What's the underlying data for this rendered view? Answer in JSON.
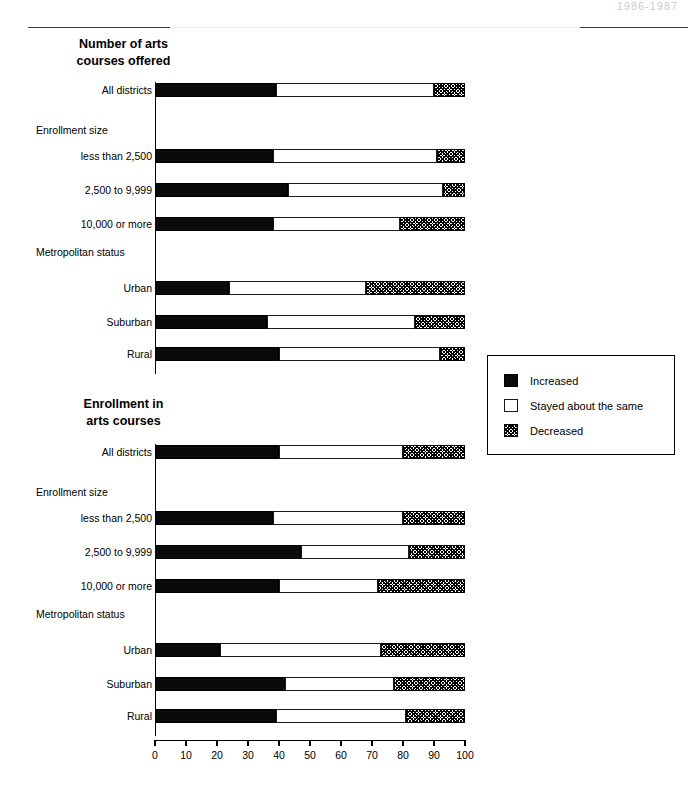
{
  "header": {
    "year_range": "1986-1987"
  },
  "legend": {
    "items": [
      {
        "label": "Increased",
        "key": "increased",
        "color": "#000000"
      },
      {
        "label": "Stayed about the same",
        "key": "same",
        "color": "#ffffff"
      },
      {
        "label": "Decreased",
        "key": "decreased",
        "color": "#7a7a7a"
      }
    ]
  },
  "axis": {
    "ticks": [
      "0",
      "10",
      "20",
      "30",
      "40",
      "50",
      "60",
      "70",
      "80",
      "90",
      "100"
    ],
    "min": 0,
    "max": 100
  },
  "group_labels": {
    "enrollment_size": "Enrollment size",
    "metropolitan_status": "Metropolitan status"
  },
  "chart_data": [
    {
      "type": "bar",
      "orientation": "horizontal",
      "stacked": true,
      "title": "Number of arts\ncourses offered",
      "xlabel": "",
      "ylabel": "",
      "xlim": [
        0,
        100
      ],
      "grid": false,
      "legend_position": "right",
      "series": [
        {
          "name": "Increased",
          "values": [
            39,
            38,
            43,
            38,
            24,
            36,
            40
          ]
        },
        {
          "name": "Stayed about the same",
          "values": [
            51,
            53,
            50,
            41,
            44,
            48,
            52
          ]
        },
        {
          "name": "Decreased",
          "values": [
            10,
            9,
            7,
            21,
            32,
            16,
            8
          ]
        }
      ],
      "categories": [
        "All districts",
        "less than 2,500",
        "2,500 to 9,999",
        "10,000 or more",
        "Urban",
        "Suburban",
        "Rural"
      ],
      "rows": [
        {
          "label": "All districts",
          "kind": "bar",
          "increased": 39,
          "same": 51,
          "decreased": 10
        },
        {
          "label": "Enrollment size",
          "kind": "group"
        },
        {
          "label": "less than 2,500",
          "kind": "bar",
          "increased": 38,
          "same": 53,
          "decreased": 9
        },
        {
          "label": "2,500 to 9,999",
          "kind": "bar",
          "increased": 43,
          "same": 50,
          "decreased": 7
        },
        {
          "label": "10,000 or more",
          "kind": "bar",
          "increased": 38,
          "same": 41,
          "decreased": 21
        },
        {
          "label": "Metropolitan status",
          "kind": "group"
        },
        {
          "label": "Urban",
          "kind": "bar",
          "increased": 24,
          "same": 44,
          "decreased": 32
        },
        {
          "label": "Suburban",
          "kind": "bar",
          "increased": 36,
          "same": 48,
          "decreased": 16
        },
        {
          "label": "Rural",
          "kind": "bar",
          "increased": 40,
          "same": 52,
          "decreased": 8
        }
      ]
    },
    {
      "type": "bar",
      "orientation": "horizontal",
      "stacked": true,
      "title": "Enrollment in\narts courses",
      "xlabel": "",
      "ylabel": "",
      "xlim": [
        0,
        100
      ],
      "grid": false,
      "legend_position": "right",
      "series": [
        {
          "name": "Increased",
          "values": [
            40,
            38,
            47,
            40,
            21,
            42,
            39
          ]
        },
        {
          "name": "Stayed about the same",
          "values": [
            40,
            42,
            35,
            32,
            52,
            35,
            42
          ]
        },
        {
          "name": "Decreased",
          "values": [
            20,
            20,
            18,
            28,
            27,
            23,
            19
          ]
        }
      ],
      "categories": [
        "All districts",
        "less than 2,500",
        "2,500 to 9,999",
        "10,000 or more",
        "Urban",
        "Suburban",
        "Rural"
      ],
      "rows": [
        {
          "label": "All districts",
          "kind": "bar",
          "increased": 40,
          "same": 40,
          "decreased": 20
        },
        {
          "label": "Enrollment size",
          "kind": "group"
        },
        {
          "label": "less than 2,500",
          "kind": "bar",
          "increased": 38,
          "same": 42,
          "decreased": 20
        },
        {
          "label": "2,500 to 9,999",
          "kind": "bar",
          "increased": 47,
          "same": 35,
          "decreased": 18
        },
        {
          "label": "10,000 or more",
          "kind": "bar",
          "increased": 40,
          "same": 32,
          "decreased": 28
        },
        {
          "label": "Metropolitan status",
          "kind": "group"
        },
        {
          "label": "Urban",
          "kind": "bar",
          "increased": 21,
          "same": 52,
          "decreased": 27
        },
        {
          "label": "Suburban",
          "kind": "bar",
          "increased": 42,
          "same": 35,
          "decreased": 23
        },
        {
          "label": "Rural",
          "kind": "bar",
          "increased": 39,
          "same": 42,
          "decreased": 19
        }
      ]
    }
  ]
}
